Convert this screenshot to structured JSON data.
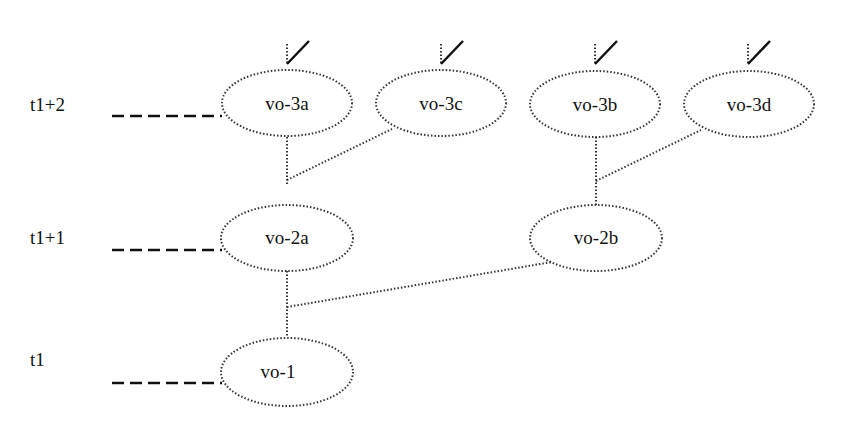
{
  "diagram": {
    "levels": [
      {
        "label": "t1+2",
        "y": 104
      },
      {
        "label": "t1+1",
        "y": 238
      },
      {
        "label": "t1",
        "y": 372
      }
    ],
    "nodes": [
      {
        "id": "vo-3a",
        "label": "vo-3a",
        "cx": 286,
        "cy": 104,
        "checked": true
      },
      {
        "id": "vo-3c",
        "label": "vo-3c",
        "cx": 440,
        "cy": 104,
        "checked": true
      },
      {
        "id": "vo-3b",
        "label": "vo-3b",
        "cx": 595,
        "cy": 104,
        "checked": true
      },
      {
        "id": "vo-3d",
        "label": "vo-3d",
        "cx": 748,
        "cy": 104,
        "checked": true
      },
      {
        "id": "vo-2a",
        "label": "vo-2a",
        "cx": 286,
        "cy": 238,
        "checked": false
      },
      {
        "id": "vo-2b",
        "label": "vo-2b",
        "cx": 596,
        "cy": 238,
        "checked": false
      },
      {
        "id": "vo-1",
        "label": "vo-1",
        "cx": 286,
        "cy": 372,
        "checked": false
      }
    ],
    "edges": [
      {
        "from": "vo-3a",
        "to": "vo-2a"
      },
      {
        "from": "vo-3c",
        "to": "vo-2a"
      },
      {
        "from": "vo-3b",
        "to": "vo-2b"
      },
      {
        "from": "vo-3d",
        "to": "vo-2b"
      },
      {
        "from": "vo-2a",
        "to": "vo-1"
      },
      {
        "from": "vo-2b",
        "to": "vo-1"
      }
    ]
  }
}
